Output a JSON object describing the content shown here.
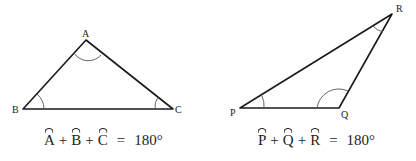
{
  "triangle_abc": {
    "vertices": {
      "A": {
        "label": "A",
        "x": 86,
        "y": 40
      },
      "B": {
        "label": "B",
        "x": 23,
        "y": 109
      },
      "C": {
        "label": "C",
        "x": 173,
        "y": 109
      }
    },
    "formula": {
      "angle1": "A",
      "angle2": "B",
      "angle3": "C",
      "plus": "+",
      "equals": "=",
      "total": "180°"
    }
  },
  "triangle_pqr": {
    "vertices": {
      "P": {
        "label": "P",
        "x": 240,
        "y": 108
      },
      "Q": {
        "label": "Q",
        "x": 339,
        "y": 108
      },
      "R": {
        "label": "R",
        "x": 392,
        "y": 14
      }
    },
    "formula": {
      "angle1": "P",
      "angle2": "Q",
      "angle3": "R",
      "plus": "+",
      "equals": "=",
      "total": "180°"
    }
  },
  "colors": {
    "stroke": "#1a1a1a",
    "arc": "#555555",
    "text": "#222222",
    "background": "#ffffff"
  }
}
